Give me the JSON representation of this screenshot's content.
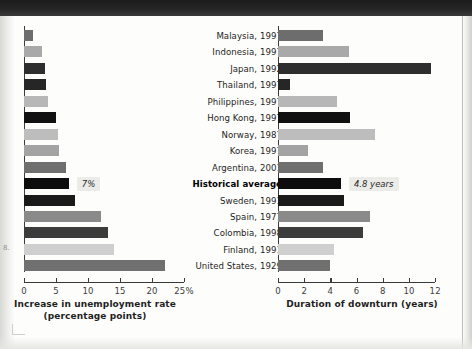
{
  "figure": {
    "margin_note": "8.",
    "background_color": "#fdfdfb"
  },
  "categories": [
    "Malaysia, 1997",
    "Indonesia, 1997",
    "Japan, 1992",
    "Thailand, 1997",
    "Philippines, 1997",
    "Hong Kong, 1997",
    "Norway, 1987",
    "Korea, 1997",
    "Argentina, 2001",
    "Historical average",
    "Sweden, 1991",
    "Spain, 1977",
    "Colombia, 1998",
    "Finland, 1991",
    "United States, 1929"
  ],
  "highlight_category": "Historical average",
  "chart_data": [
    {
      "type": "bar",
      "orientation": "horizontal",
      "id": "unemployment",
      "title": "",
      "xlabel": "Increase in unemployment rate (percentage points)",
      "xlabel_line1": "Increase in unemployment rate",
      "xlabel_line2": "(percentage points)",
      "ylabel": "",
      "xlim": [
        0,
        25
      ],
      "xticks": [
        0,
        5,
        10,
        15,
        20,
        25
      ],
      "xticklabels": [
        "0",
        "5",
        "10",
        "15",
        "20",
        "25%"
      ],
      "grid": false,
      "legend": "none",
      "categories": [
        "Malaysia, 1997",
        "Indonesia, 1997",
        "Japan, 1992",
        "Thailand, 1997",
        "Philippines, 1997",
        "Hong Kong, 1997",
        "Norway, 1987",
        "Korea, 1997",
        "Argentina, 2001",
        "Historical average",
        "Sweden, 1991",
        "Spain, 1977",
        "Colombia, 1998",
        "Finland, 1991",
        "United States, 1929"
      ],
      "values": [
        1.4,
        2.8,
        3.3,
        3.5,
        3.7,
        5.0,
        5.3,
        5.4,
        6.5,
        7.0,
        8.0,
        12.0,
        13.2,
        14.0,
        22.0
      ],
      "bar_colors": [
        "#6d6d6d",
        "#a9a9a9",
        "#2e2e2e",
        "#262626",
        "#b7b7b7",
        "#111111",
        "#bdbdbd",
        "#a3a3a3",
        "#6f6f6f",
        "#0d0d0d",
        "#1a1a1a",
        "#8a8a8a",
        "#3c3c3c",
        "#cfcfcf",
        "#707070"
      ],
      "annotations": [
        {
          "category": "Historical average",
          "text": "7%",
          "value": 7.0
        }
      ]
    },
    {
      "type": "bar",
      "orientation": "horizontal",
      "id": "duration",
      "title": "",
      "xlabel": "Duration of downturn (years)",
      "xlabel_line1": "Duration of downturn (years)",
      "xlabel_line2": "",
      "ylabel": "",
      "xlim": [
        0,
        12
      ],
      "xticks": [
        0,
        2,
        4,
        6,
        8,
        10,
        12
      ],
      "xticklabels": [
        "0",
        "2",
        "4",
        "6",
        "8",
        "10",
        "12"
      ],
      "grid": false,
      "legend": "none",
      "categories": [
        "Malaysia, 1997",
        "Indonesia, 1997",
        "Japan, 1992",
        "Thailand, 1997",
        "Philippines, 1997",
        "Hong Kong, 1997",
        "Norway, 1987",
        "Korea, 1997",
        "Argentina, 2001",
        "Historical average",
        "Sweden, 1991",
        "Spain, 1977",
        "Colombia, 1998",
        "Finland, 1991",
        "United States, 1929"
      ],
      "values": [
        3.4,
        5.4,
        11.7,
        0.9,
        4.5,
        5.5,
        7.4,
        2.3,
        3.4,
        4.8,
        5.0,
        7.0,
        6.5,
        4.3,
        4.0
      ],
      "bar_colors": [
        "#6d6d6d",
        "#a9a9a9",
        "#2e2e2e",
        "#262626",
        "#b7b7b7",
        "#111111",
        "#bdbdbd",
        "#a3a3a3",
        "#6f6f6f",
        "#0d0d0d",
        "#1a1a1a",
        "#8a8a8a",
        "#3c3c3c",
        "#cfcfcf",
        "#707070"
      ],
      "annotations": [
        {
          "category": "Historical average",
          "text": "4.8 years",
          "value": 4.8
        }
      ]
    }
  ]
}
